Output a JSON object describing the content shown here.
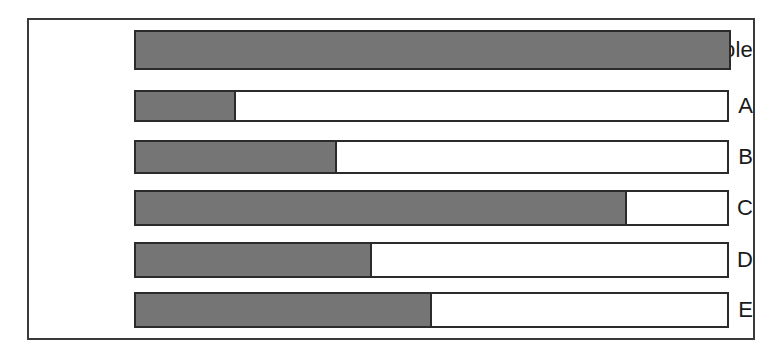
{
  "figure": {
    "background_color": "#ffffff",
    "frame_color": "#3a3a3a",
    "bar_border_color": "#2b2b2b",
    "bar_fill_color": "#757575",
    "bar_empty_color": "#ffffff",
    "label_color": "#1a1a1a"
  },
  "chart_data": {
    "type": "bar",
    "orientation": "horizontal",
    "title": "",
    "xlabel": "",
    "ylabel": "",
    "xlim": [
      0,
      1
    ],
    "grid": false,
    "legend": false,
    "note": "Each row is a unit-length bar; the shaded portion shows the fraction filled.",
    "categories": [
      "whole",
      "A",
      "B",
      "C",
      "D",
      "E"
    ],
    "values": [
      1.0,
      0.17,
      0.34,
      0.83,
      0.4,
      0.5
    ],
    "percent_labels": [
      "100%",
      "17%",
      "34%",
      "83%",
      "40%",
      "50%"
    ],
    "rows": [
      {
        "label": "whole",
        "fraction": 1.0,
        "percent": 100,
        "fill_css": "100%",
        "top": 10,
        "height": 40
      },
      {
        "label": "A",
        "fraction": 0.17,
        "percent": 17,
        "fill_css": "17%",
        "top": 70,
        "height": 32
      },
      {
        "label": "B",
        "fraction": 0.34,
        "percent": 34,
        "fill_css": "34%",
        "top": 120,
        "height": 34
      },
      {
        "label": "C",
        "fraction": 0.83,
        "percent": 83,
        "fill_css": "83%",
        "top": 170,
        "height": 36
      },
      {
        "label": "D",
        "fraction": 0.4,
        "percent": 40,
        "fill_css": "40%",
        "top": 222,
        "height": 36
      },
      {
        "label": "E",
        "fraction": 0.5,
        "percent": 50,
        "fill_css": "50%",
        "top": 272,
        "height": 36
      }
    ]
  }
}
